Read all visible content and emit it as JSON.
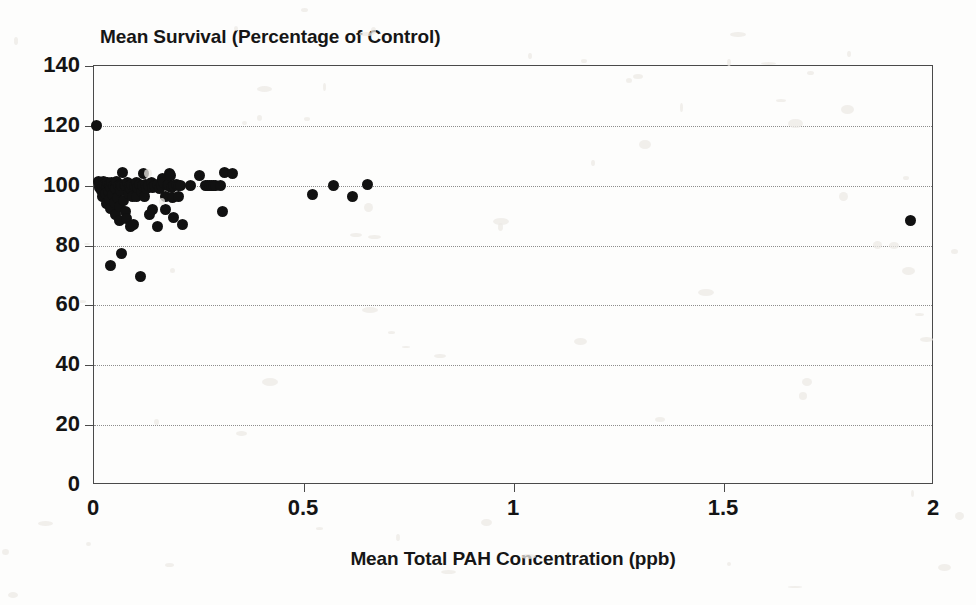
{
  "chart_data": {
    "type": "scatter",
    "title": "Mean Survival (Percentage of Control)",
    "xlabel": "Mean Total PAH Concentration (ppb)",
    "ylabel": "",
    "xlim": [
      0,
      2
    ],
    "ylim": [
      0,
      140
    ],
    "xticks": [
      "0",
      "0.5",
      "1",
      "1.5",
      "2"
    ],
    "xtick_values": [
      0,
      0.5,
      1,
      1.5,
      2
    ],
    "yticks": [
      "0",
      "20",
      "40",
      "60",
      "80",
      "100",
      "120",
      "140"
    ],
    "ytick_values": [
      0,
      20,
      40,
      60,
      80,
      100,
      120,
      140
    ],
    "grid": "horizontal-dotted",
    "legend": "none",
    "marker": "filled-circle",
    "marker_color": "#111111",
    "series": [
      {
        "name": "Stations",
        "points": [
          [
            0.005,
            120.0
          ],
          [
            0.01,
            101.5
          ],
          [
            0.012,
            100.5
          ],
          [
            0.014,
            99.5
          ],
          [
            0.016,
            101.0
          ],
          [
            0.018,
            98.5
          ],
          [
            0.02,
            100.0
          ],
          [
            0.02,
            96.5
          ],
          [
            0.022,
            101.5
          ],
          [
            0.024,
            99.0
          ],
          [
            0.026,
            100.5
          ],
          [
            0.028,
            97.5
          ],
          [
            0.03,
            100.0
          ],
          [
            0.03,
            94.0
          ],
          [
            0.032,
            101.0
          ],
          [
            0.034,
            98.0
          ],
          [
            0.036,
            100.5
          ],
          [
            0.038,
            95.5
          ],
          [
            0.04,
            99.5
          ],
          [
            0.04,
            92.5
          ],
          [
            0.04,
            73.5
          ],
          [
            0.042,
            101.0
          ],
          [
            0.044,
            97.0
          ],
          [
            0.046,
            100.0
          ],
          [
            0.048,
            94.5
          ],
          [
            0.05,
            100.5
          ],
          [
            0.05,
            90.5
          ],
          [
            0.052,
            99.0
          ],
          [
            0.054,
            101.5
          ],
          [
            0.056,
            96.0
          ],
          [
            0.058,
            100.0
          ],
          [
            0.06,
            93.0
          ],
          [
            0.06,
            88.5
          ],
          [
            0.062,
            100.5
          ],
          [
            0.064,
            98.5
          ],
          [
            0.065,
            77.5
          ],
          [
            0.066,
            100.0
          ],
          [
            0.068,
            104.5
          ],
          [
            0.07,
            95.0
          ],
          [
            0.072,
            100.5
          ],
          [
            0.074,
            91.5
          ],
          [
            0.076,
            100.0
          ],
          [
            0.078,
            89.0
          ],
          [
            0.08,
            101.0
          ],
          [
            0.082,
            97.5
          ],
          [
            0.084,
            100.0
          ],
          [
            0.086,
            86.5
          ],
          [
            0.088,
            99.0
          ],
          [
            0.09,
            100.5
          ],
          [
            0.092,
            96.5
          ],
          [
            0.094,
            87.0
          ],
          [
            0.096,
            100.0
          ],
          [
            0.1,
            101.0
          ],
          [
            0.1,
            96.5
          ],
          [
            0.104,
            99.5
          ],
          [
            0.108,
            100.5
          ],
          [
            0.11,
            69.5
          ],
          [
            0.112,
            98.0
          ],
          [
            0.116,
            100.0
          ],
          [
            0.118,
            104.0
          ],
          [
            0.12,
            96.5
          ],
          [
            0.122,
            100.5
          ],
          [
            0.126,
            99.0
          ],
          [
            0.13,
            100.0
          ],
          [
            0.132,
            90.5
          ],
          [
            0.136,
            101.0
          ],
          [
            0.14,
            99.5
          ],
          [
            0.14,
            92.0
          ],
          [
            0.144,
            100.0
          ],
          [
            0.15,
            100.5
          ],
          [
            0.15,
            86.5
          ],
          [
            0.156,
            99.0
          ],
          [
            0.16,
            100.0
          ],
          [
            0.162,
            102.5
          ],
          [
            0.166,
            101.0
          ],
          [
            0.17,
            96.5
          ],
          [
            0.17,
            92.0
          ],
          [
            0.174,
            100.0
          ],
          [
            0.178,
            100.5
          ],
          [
            0.18,
            104.0
          ],
          [
            0.182,
            103.5
          ],
          [
            0.184,
            99.5
          ],
          [
            0.186,
            96.0
          ],
          [
            0.19,
            100.0
          ],
          [
            0.19,
            89.5
          ],
          [
            0.196,
            100.5
          ],
          [
            0.2,
            100.0
          ],
          [
            0.2,
            96.5
          ],
          [
            0.206,
            100.0
          ],
          [
            0.21,
            87.0
          ],
          [
            0.23,
            100.0
          ],
          [
            0.25,
            103.5
          ],
          [
            0.265,
            100.0
          ],
          [
            0.27,
            100.0
          ],
          [
            0.275,
            100.0
          ],
          [
            0.28,
            100.0
          ],
          [
            0.285,
            100.0
          ],
          [
            0.29,
            100.0
          ],
          [
            0.3,
            100.0
          ],
          [
            0.305,
            91.5
          ],
          [
            0.31,
            104.5
          ],
          [
            0.33,
            104.0
          ],
          [
            0.52,
            97.0
          ],
          [
            0.57,
            100.0
          ],
          [
            0.615,
            96.5
          ],
          [
            0.65,
            100.5
          ],
          [
            1.945,
            88.5
          ]
        ]
      }
    ]
  },
  "figure": {
    "background_color": "#ffffff",
    "frame_color": "#4a4a4a",
    "grid_color": "#8d8d8d"
  }
}
